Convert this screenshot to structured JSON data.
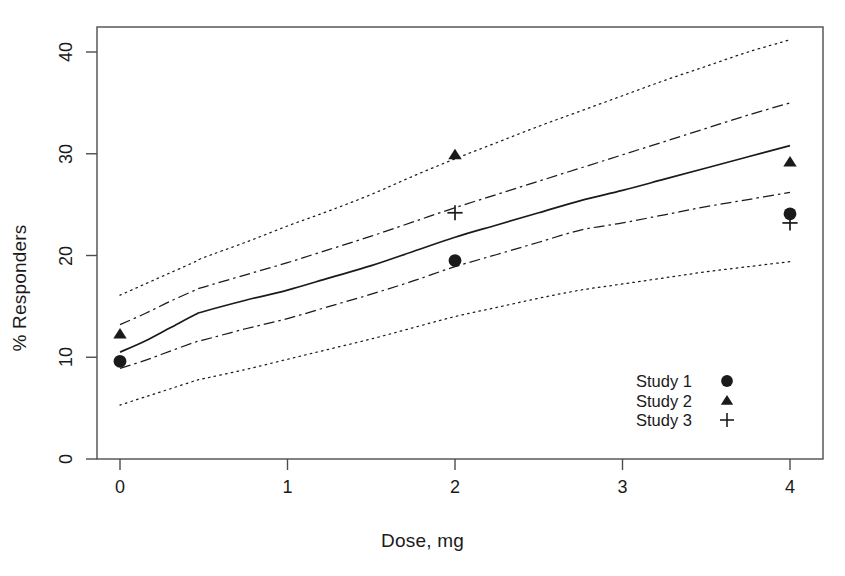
{
  "chart_data": {
    "type": "line",
    "title": "",
    "xlabel": "Dose, mg",
    "ylabel": "% Responders",
    "xlim": [
      -0.15,
      4.2
    ],
    "ylim": [
      -1.5,
      41.8
    ],
    "xticks": [
      "0",
      "1",
      "2",
      "3",
      "4"
    ],
    "xtick_values": [
      0,
      1,
      2,
      3,
      4
    ],
    "yticks": [
      "0",
      "10",
      "20",
      "30",
      "40"
    ],
    "ytick_values": [
      0,
      10,
      20,
      30,
      40
    ],
    "grid": false,
    "legend_position": "bottom-right",
    "series": [
      {
        "name": "Model mean",
        "style": "solid",
        "x": [
          0,
          0.15,
          0.3,
          0.45,
          0.5,
          0.75,
          1.0,
          1.25,
          1.5,
          1.75,
          2.0,
          2.25,
          2.5,
          2.75,
          3.0,
          3.25,
          3.5,
          3.75,
          4.0
        ],
        "values": [
          10.5,
          11.6,
          12.9,
          14.2,
          14.5,
          15.6,
          16.6,
          17.8,
          19.0,
          20.4,
          21.8,
          23.0,
          24.2,
          25.4,
          26.4,
          27.5,
          28.6,
          29.7,
          30.8
        ]
      },
      {
        "name": "Inner band upper",
        "style": "dashdot",
        "x": [
          0,
          0.15,
          0.3,
          0.45,
          0.5,
          0.75,
          1.0,
          1.25,
          1.5,
          1.75,
          2.0,
          2.25,
          2.5,
          2.75,
          3.0,
          3.25,
          3.5,
          3.75,
          4.0
        ],
        "values": [
          13.2,
          14.3,
          15.5,
          16.6,
          16.9,
          18.1,
          19.3,
          20.6,
          21.9,
          23.3,
          24.7,
          26.0,
          27.3,
          28.6,
          29.9,
          31.2,
          32.5,
          33.8,
          35.0
        ]
      },
      {
        "name": "Inner band lower",
        "style": "dashdot",
        "x": [
          0,
          0.15,
          0.3,
          0.45,
          0.5,
          0.75,
          1.0,
          1.25,
          1.5,
          1.75,
          2.0,
          2.25,
          2.5,
          2.75,
          3.0,
          3.25,
          3.5,
          3.75,
          4.0
        ],
        "values": [
          8.9,
          9.7,
          10.6,
          11.5,
          11.7,
          12.8,
          13.8,
          15.0,
          16.2,
          17.5,
          18.9,
          20.1,
          21.3,
          22.5,
          23.2,
          24.0,
          24.8,
          25.5,
          26.2
        ]
      },
      {
        "name": "Outer band upper",
        "style": "dotted",
        "x": [
          0,
          0.15,
          0.3,
          0.45,
          0.5,
          0.75,
          1.0,
          1.25,
          1.5,
          1.75,
          2.0,
          2.25,
          2.5,
          2.75,
          3.0,
          3.25,
          3.5,
          3.75,
          4.0
        ],
        "values": [
          16.1,
          17.2,
          18.3,
          19.4,
          19.8,
          21.3,
          22.9,
          24.4,
          26.0,
          27.8,
          29.5,
          31.1,
          32.7,
          34.2,
          35.7,
          37.2,
          38.6,
          40.0,
          41.2
        ]
      },
      {
        "name": "Outer band lower",
        "style": "dotted",
        "x": [
          0,
          0.15,
          0.3,
          0.45,
          0.5,
          0.75,
          1.0,
          1.25,
          1.5,
          1.75,
          2.0,
          2.25,
          2.5,
          2.75,
          3.0,
          3.25,
          3.5,
          3.75,
          4.0
        ],
        "values": [
          5.3,
          6.1,
          6.9,
          7.7,
          7.9,
          8.8,
          9.8,
          10.8,
          11.8,
          12.9,
          14.0,
          14.9,
          15.8,
          16.6,
          17.2,
          17.8,
          18.4,
          18.9,
          19.4
        ]
      }
    ],
    "scatter": [
      {
        "name": "Study 1",
        "marker": "circle",
        "points": [
          {
            "x": 0,
            "y": 9.6
          },
          {
            "x": 2,
            "y": 19.5
          },
          {
            "x": 4,
            "y": 24.1
          }
        ]
      },
      {
        "name": "Study 2",
        "marker": "triangle",
        "points": [
          {
            "x": 0,
            "y": 12.3
          },
          {
            "x": 2,
            "y": 29.9
          },
          {
            "x": 4,
            "y": 29.2
          }
        ]
      },
      {
        "name": "Study 3",
        "marker": "plus",
        "points": [
          {
            "x": 2,
            "y": 24.2
          },
          {
            "x": 4,
            "y": 23.2
          }
        ]
      }
    ]
  },
  "legend": {
    "items": [
      {
        "label": "Study 1",
        "marker": "circle"
      },
      {
        "label": "Study 2",
        "marker": "triangle"
      },
      {
        "label": "Study 3",
        "marker": "plus"
      }
    ]
  },
  "colors": {
    "line": "#1a1a1a",
    "axis": "#4d4d4d",
    "text": "#1a1a1a",
    "background": "#ffffff"
  }
}
